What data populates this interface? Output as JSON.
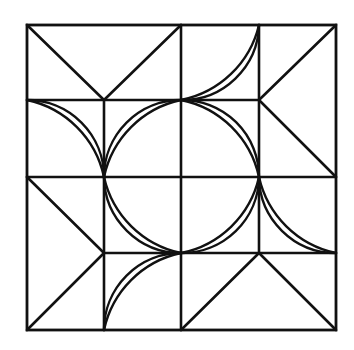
{
  "diagram": {
    "colors": {
      "background": "#ffffff",
      "stroke": "#111111"
    },
    "grid": {
      "x": [
        27,
        104,
        181,
        259,
        336
      ],
      "y": [
        25,
        100,
        177,
        253,
        330
      ]
    },
    "motifs": [
      {
        "region": "top-left-two-cells",
        "shape": "V",
        "points": [
          [
            27,
            25
          ],
          [
            104,
            100
          ],
          [
            181,
            25
          ]
        ]
      },
      {
        "region": "right-top-two-cells",
        "shape": "chevron-left",
        "points": [
          [
            336,
            25
          ],
          [
            259,
            100
          ],
          [
            336,
            177
          ]
        ]
      },
      {
        "region": "left-bottom-two-cells",
        "shape": "chevron-right",
        "points": [
          [
            27,
            177
          ],
          [
            104,
            253
          ],
          [
            27,
            330
          ]
        ]
      },
      {
        "region": "bottom-right-two-cells",
        "shape": "caret-up",
        "points": [
          [
            181,
            330
          ],
          [
            259,
            253
          ],
          [
            336,
            330
          ]
        ]
      }
    ],
    "double_arcs": [
      {
        "from": [
          27,
          100
        ],
        "to": [
          104,
          177
        ],
        "center": [
          27,
          177
        ]
      },
      {
        "from": [
          181,
          100
        ],
        "to": [
          104,
          177
        ],
        "center": [
          181,
          177
        ]
      },
      {
        "from": [
          181,
          100
        ],
        "to": [
          259,
          25
        ],
        "center": [
          181,
          25
        ]
      },
      {
        "from": [
          181,
          100
        ],
        "to": [
          259,
          177
        ],
        "center": [
          181,
          177
        ]
      },
      {
        "from": [
          104,
          177
        ],
        "to": [
          181,
          253
        ],
        "center": [
          181,
          177
        ]
      },
      {
        "from": [
          104,
          330
        ],
        "to": [
          181,
          253
        ],
        "center": [
          181,
          330
        ]
      },
      {
        "from": [
          181,
          253
        ],
        "to": [
          259,
          177
        ],
        "center": [
          181,
          177
        ]
      },
      {
        "from": [
          259,
          177
        ],
        "to": [
          336,
          253
        ],
        "center": [
          336,
          177
        ]
      }
    ]
  }
}
